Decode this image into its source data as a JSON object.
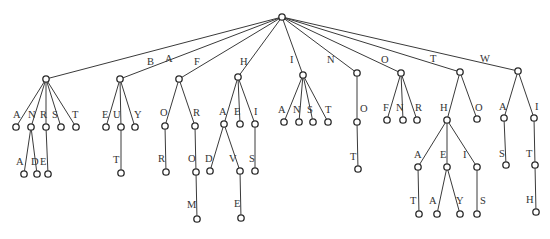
{
  "diagram": {
    "type": "trie",
    "root": {
      "id": "root",
      "x": 282,
      "y": 17
    },
    "nodes": [
      {
        "id": "A",
        "x": 46,
        "y": 79,
        "parent": "root",
        "label": "A",
        "lx": 165,
        "ly": 62
      },
      {
        "id": "B",
        "x": 120,
        "y": 79,
        "parent": "root",
        "label": "B",
        "lx": 147,
        "ly": 65
      },
      {
        "id": "F",
        "x": 179,
        "y": 79,
        "parent": "root",
        "label": "F",
        "lx": 194,
        "ly": 65
      },
      {
        "id": "H",
        "x": 238,
        "y": 77,
        "parent": "root",
        "label": "H",
        "lx": 240,
        "ly": 65
      },
      {
        "id": "I",
        "x": 303,
        "y": 75,
        "parent": "root",
        "label": "I",
        "lx": 290,
        "ly": 63
      },
      {
        "id": "N",
        "x": 357,
        "y": 73,
        "parent": "root",
        "label": "N",
        "lx": 327,
        "ly": 63
      },
      {
        "id": "O",
        "x": 401,
        "y": 73,
        "parent": "root",
        "label": "O",
        "lx": 381,
        "ly": 63
      },
      {
        "id": "T",
        "x": 460,
        "y": 72,
        "parent": "root",
        "label": "T",
        "lx": 430,
        "ly": 62
      },
      {
        "id": "W",
        "x": 518,
        "y": 71,
        "parent": "root",
        "label": "W",
        "lx": 480,
        "ly": 62
      },
      {
        "id": "AA",
        "x": 16,
        "y": 127,
        "parent": "A",
        "label": "A",
        "lx": 13,
        "ly": 118
      },
      {
        "id": "AN",
        "x": 31,
        "y": 127,
        "parent": "A",
        "label": "N",
        "lx": 28,
        "ly": 118
      },
      {
        "id": "AR",
        "x": 46,
        "y": 127,
        "parent": "A",
        "label": "R",
        "lx": 40,
        "ly": 118
      },
      {
        "id": "AS",
        "x": 61,
        "y": 127,
        "parent": "A",
        "label": "S",
        "lx": 52,
        "ly": 118
      },
      {
        "id": "AT",
        "x": 76,
        "y": 127,
        "parent": "A",
        "label": "T",
        "lx": 72,
        "ly": 118
      },
      {
        "id": "ANA",
        "x": 24,
        "y": 174,
        "parent": "AN",
        "label": "A",
        "lx": 16,
        "ly": 165
      },
      {
        "id": "AND",
        "x": 37,
        "y": 174,
        "parent": "AN",
        "label": "D",
        "lx": 31,
        "ly": 165
      },
      {
        "id": "ARE",
        "x": 48,
        "y": 174,
        "parent": "AR",
        "label": "E",
        "lx": 40,
        "ly": 165
      },
      {
        "id": "BE",
        "x": 106,
        "y": 127,
        "parent": "B",
        "label": "E",
        "lx": 102,
        "ly": 118
      },
      {
        "id": "BU",
        "x": 121,
        "y": 127,
        "parent": "B",
        "label": "U",
        "lx": 113,
        "ly": 118
      },
      {
        "id": "BY",
        "x": 135,
        "y": 127,
        "parent": "B",
        "label": "Y",
        "lx": 134,
        "ly": 118
      },
      {
        "id": "BUT",
        "x": 121,
        "y": 173,
        "parent": "BU",
        "label": "T",
        "lx": 113,
        "ly": 163
      },
      {
        "id": "FO",
        "x": 165,
        "y": 126,
        "parent": "F",
        "label": "O",
        "lx": 160,
        "ly": 116
      },
      {
        "id": "FR",
        "x": 195,
        "y": 126,
        "parent": "F",
        "label": "R",
        "lx": 193,
        "ly": 116
      },
      {
        "id": "FOR",
        "x": 166,
        "y": 172,
        "parent": "FO",
        "label": "R",
        "lx": 158,
        "ly": 162
      },
      {
        "id": "FRO",
        "x": 196,
        "y": 172,
        "parent": "FR",
        "label": "O",
        "lx": 188,
        "ly": 162
      },
      {
        "id": "FROM",
        "x": 197,
        "y": 219,
        "parent": "FRO",
        "label": "M",
        "lx": 187,
        "ly": 208
      },
      {
        "id": "HA",
        "x": 224,
        "y": 124,
        "parent": "H",
        "label": "A",
        "lx": 219,
        "ly": 115
      },
      {
        "id": "HE",
        "x": 240,
        "y": 124,
        "parent": "H",
        "label": "E",
        "lx": 234,
        "ly": 115
      },
      {
        "id": "HI",
        "x": 255,
        "y": 124,
        "parent": "H",
        "label": "I",
        "lx": 254,
        "ly": 115
      },
      {
        "id": "HAD",
        "x": 210,
        "y": 171,
        "parent": "HA",
        "label": "D",
        "lx": 205,
        "ly": 162
      },
      {
        "id": "HAV",
        "x": 240,
        "y": 171,
        "parent": "HA",
        "label": "V",
        "lx": 229,
        "ly": 162
      },
      {
        "id": "HIS",
        "x": 255,
        "y": 171,
        "parent": "HI",
        "label": "S",
        "lx": 249,
        "ly": 162
      },
      {
        "id": "HAVE",
        "x": 241,
        "y": 218,
        "parent": "HAV",
        "label": "E",
        "lx": 234,
        "ly": 207
      },
      {
        "id": "IA",
        "x": 284,
        "y": 122,
        "parent": "I",
        "label": "A",
        "lx": 278,
        "ly": 113
      },
      {
        "id": "IN",
        "x": 299,
        "y": 122,
        "parent": "I",
        "label": "N",
        "lx": 293,
        "ly": 113
      },
      {
        "id": "IS",
        "x": 313,
        "y": 122,
        "parent": "I",
        "label": "S",
        "lx": 307,
        "ly": 113
      },
      {
        "id": "IT",
        "x": 328,
        "y": 122,
        "parent": "I",
        "label": "T",
        "lx": 325,
        "ly": 113
      },
      {
        "id": "NO",
        "x": 357,
        "y": 122,
        "parent": "N",
        "label": "O",
        "lx": 360,
        "ly": 112
      },
      {
        "id": "NOT",
        "x": 358,
        "y": 169,
        "parent": "NO",
        "label": "T",
        "lx": 350,
        "ly": 160
      },
      {
        "id": "OF",
        "x": 387,
        "y": 120,
        "parent": "O",
        "label": "F",
        "lx": 383,
        "ly": 111
      },
      {
        "id": "ON",
        "x": 403,
        "y": 120,
        "parent": "O",
        "label": "N",
        "lx": 396,
        "ly": 111
      },
      {
        "id": "OR",
        "x": 417,
        "y": 120,
        "parent": "O",
        "label": "R",
        "lx": 415,
        "ly": 111
      },
      {
        "id": "TH",
        "x": 447,
        "y": 120,
        "parent": "T",
        "label": "H",
        "lx": 440,
        "ly": 111
      },
      {
        "id": "TO",
        "x": 477,
        "y": 119,
        "parent": "T",
        "label": "O",
        "lx": 475,
        "ly": 111
      },
      {
        "id": "THA",
        "x": 418,
        "y": 167,
        "parent": "TH",
        "label": "A",
        "lx": 414,
        "ly": 158
      },
      {
        "id": "THE",
        "x": 447,
        "y": 167,
        "parent": "TH",
        "label": "E",
        "lx": 440,
        "ly": 158
      },
      {
        "id": "THI",
        "x": 477,
        "y": 167,
        "parent": "TH",
        "label": "I",
        "lx": 463,
        "ly": 158
      },
      {
        "id": "THAT",
        "x": 419,
        "y": 214,
        "parent": "THA",
        "label": "T",
        "lx": 410,
        "ly": 204
      },
      {
        "id": "THEA",
        "x": 437,
        "y": 214,
        "parent": "THE",
        "label": "A",
        "lx": 429,
        "ly": 204
      },
      {
        "id": "THEY",
        "x": 460,
        "y": 214,
        "parent": "THE",
        "label": "Y",
        "lx": 456,
        "ly": 204
      },
      {
        "id": "THIS",
        "x": 477,
        "y": 214,
        "parent": "THI",
        "label": "S",
        "lx": 480,
        "ly": 204
      },
      {
        "id": "WA",
        "x": 504,
        "y": 118,
        "parent": "W",
        "label": "A",
        "lx": 499,
        "ly": 110
      },
      {
        "id": "WI",
        "x": 534,
        "y": 118,
        "parent": "W",
        "label": "I",
        "lx": 535,
        "ly": 110
      },
      {
        "id": "WAS",
        "x": 506,
        "y": 165,
        "parent": "WA",
        "label": "S",
        "lx": 499,
        "ly": 157
      },
      {
        "id": "WIT",
        "x": 535,
        "y": 165,
        "parent": "WI",
        "label": "T",
        "lx": 526,
        "ly": 157
      },
      {
        "id": "WITH",
        "x": 536,
        "y": 212,
        "parent": "WIT",
        "label": "H",
        "lx": 526,
        "ly": 203
      }
    ]
  }
}
